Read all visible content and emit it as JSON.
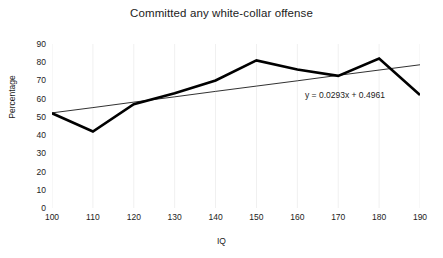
{
  "chart_data": {
    "type": "line",
    "title": "Committed any white-collar offense",
    "xlabel": "IQ",
    "ylabel": "Percentage",
    "x": [
      100,
      110,
      120,
      130,
      140,
      150,
      160,
      170,
      180,
      190
    ],
    "xlim": [
      100,
      190
    ],
    "ylim": [
      0,
      90
    ],
    "xticks": [
      "100",
      "110",
      "120",
      "130",
      "140",
      "150",
      "160",
      "170",
      "180",
      "190"
    ],
    "yticks": [
      "0",
      "10",
      "20",
      "30",
      "40",
      "50",
      "60",
      "70",
      "80",
      "90"
    ],
    "grid": "vertical-light",
    "legend": "none",
    "series": [
      {
        "name": "Committed any white-collar offense",
        "type": "line",
        "color": "#000000",
        "width": 2.6,
        "values": [
          52,
          42,
          57,
          63,
          70,
          81,
          76,
          72.5,
          82,
          62
        ]
      },
      {
        "name": "Linear trendline",
        "type": "trendline",
        "color": "#1a1a1a",
        "width": 0.9,
        "values": [
          52.2,
          55.1,
          58.1,
          61.0,
          64.0,
          66.9,
          69.8,
          72.8,
          75.7,
          78.6
        ]
      }
    ],
    "annotations": [
      {
        "name": "trendline-equation",
        "text": "y = 0.0293x + 0.4961",
        "x": 175,
        "y": 60
      }
    ]
  },
  "colors": {
    "series_line": "#000000",
    "trendline": "#1a1a1a",
    "gridline": "#f0f0f0",
    "text": "#1c1c1c",
    "background": "#ffffff"
  }
}
